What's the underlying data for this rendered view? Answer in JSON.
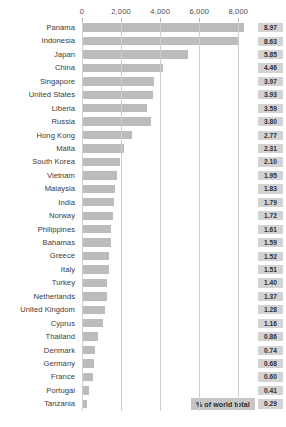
{
  "header_clipped": "",
  "legend": {
    "label": "% of world total"
  },
  "chart_data": {
    "type": "bar",
    "orientation": "horizontal",
    "title": "",
    "xlabel": "",
    "ylabel": "",
    "xlim": [
      0,
      8800
    ],
    "xticks": [
      0,
      2000,
      4000,
      6000,
      8000
    ],
    "xtick_labels": [
      "0",
      "2,000",
      "4,000",
      "6,000",
      "8,000"
    ],
    "grid": true,
    "legend_position": "bottom-right",
    "value_label_series": "% of world total",
    "categories": [
      "Panama",
      "Indonesia",
      "Japan",
      "China",
      "Singapore",
      "United States",
      "Liberia",
      "Russia",
      "Hong Kong",
      "Malta",
      "South Korea",
      "Vietnam",
      "Malaysia",
      "India",
      "Norway",
      "Philippines",
      "Bahamas",
      "Greece",
      "Italy",
      "Turkey",
      "Netherlands",
      "United Kingdom",
      "Cyprus",
      "Thailand",
      "Denmark",
      "Germany",
      "France",
      "Portugal",
      "Tanzania"
    ],
    "values": [
      8297,
      7984,
      5412,
      4126,
      3673,
      3636,
      3321,
      3516,
      2563,
      2137,
      1943,
      1804,
      1693,
      1656,
      1591,
      1489,
      1471,
      1406,
      1397,
      1295,
      1267,
      1184,
      1073,
      795,
      685,
      629,
      555,
      379,
      268
    ],
    "value_labels": [
      "8.97",
      "8.63",
      "5.85",
      "4.46",
      "3.97",
      "3.93",
      "3.59",
      "3.80",
      "2.77",
      "2.31",
      "2.10",
      "1.95",
      "1.83",
      "1.79",
      "1.72",
      "1.61",
      "1.59",
      "1.52",
      "1.51",
      "1.40",
      "1.37",
      "1.28",
      "1.16",
      "0.86",
      "0.74",
      "0.68",
      "0.60",
      "0.41",
      "0.29"
    ]
  },
  "colors": {
    "bar": "#bcbcbc",
    "value_badge": "#d3d3d3",
    "legend_badge": "#c6c6c6",
    "gridline": "#cfcfcf",
    "text": "#3a3a3a"
  }
}
